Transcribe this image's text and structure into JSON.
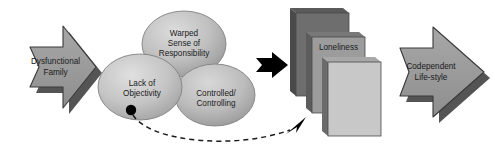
{
  "diagram": {
    "colors": {
      "arrow_fill": "#9a9a9a",
      "arrow_shadow": "#545454",
      "arrow_stroke": "#3c3c3c",
      "ellipse_light": "#d2d2d2",
      "ellipse_mid": "#b3b3b3",
      "ellipse_dark": "#9c9c9c",
      "ellipse_stroke": "#7d7d7d",
      "card_back": "#6e6e6e",
      "card_middle": "#9c9c9c",
      "card_front": "#c8c8c8",
      "card_edge": "#4a4a4a",
      "black_marker": "#000000",
      "dashed_line": "#1a1a1a",
      "text": "#1a1a1a",
      "background": "#ffffff"
    },
    "input_arrow": {
      "label_line1": "Dysfunctional",
      "label_line2": "Family"
    },
    "core_ellipses": [
      {
        "id": "warped-sense-of-responsibility",
        "label_line1": "Warped",
        "label_line2": "Sense of",
        "label_line3": "Responsibility"
      },
      {
        "id": "lack-of-objectivity",
        "label_line1": "Lack of",
        "label_line2": "Objectivity"
      },
      {
        "id": "controlled-controlling",
        "label_line1": "Controlled/",
        "label_line2": "Controlling"
      }
    ],
    "connector_arrow": {
      "name": "black-solid-arrow",
      "direction": "right"
    },
    "outcome_cards": [
      {
        "id": "card-back",
        "label": ""
      },
      {
        "id": "card-middle",
        "label": "Loneliness"
      },
      {
        "id": "card-front",
        "label": ""
      }
    ],
    "feedback_arrow": {
      "name": "dashed-feedback-arrow",
      "style": "dashed-curve",
      "from": "lack-of-objectivity",
      "to": "card-front"
    },
    "output_arrow": {
      "label_line1": "Codependent",
      "label_line2": "Life-style"
    }
  }
}
